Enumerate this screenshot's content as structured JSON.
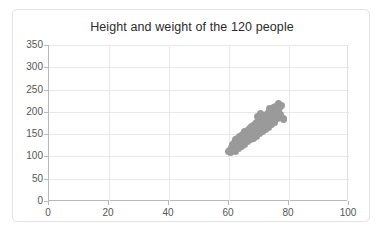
{
  "chart_data": {
    "type": "scatter",
    "title": "Height and weight of the 120 people",
    "xlabel": "",
    "ylabel": "",
    "xlim": [
      0,
      100
    ],
    "ylim": [
      0,
      350
    ],
    "xticks": [
      0,
      20,
      40,
      60,
      80,
      100
    ],
    "yticks": [
      0,
      50,
      100,
      150,
      200,
      250,
      300,
      350
    ],
    "grid": true,
    "legend": "none",
    "marker_color": "#9a9a9a",
    "series": [
      {
        "name": "people",
        "n": 120,
        "points": [
          [
            59.8,
            110
          ],
          [
            60.2,
            113
          ],
          [
            60.5,
            108
          ],
          [
            60.9,
            121
          ],
          [
            61.1,
            116
          ],
          [
            61.3,
            127
          ],
          [
            61.5,
            119
          ],
          [
            61.8,
            131
          ],
          [
            62.0,
            124
          ],
          [
            62.2,
            137
          ],
          [
            62.4,
            118
          ],
          [
            62.6,
            129
          ],
          [
            62.8,
            141
          ],
          [
            63.0,
            126
          ],
          [
            63.2,
            134
          ],
          [
            63.4,
            122
          ],
          [
            63.6,
            145
          ],
          [
            63.8,
            133
          ],
          [
            64.0,
            139
          ],
          [
            64.2,
            128
          ],
          [
            64.4,
            150
          ],
          [
            64.6,
            136
          ],
          [
            64.8,
            143
          ],
          [
            65.0,
            131
          ],
          [
            65.2,
            155
          ],
          [
            65.4,
            140
          ],
          [
            65.6,
            147
          ],
          [
            65.8,
            135
          ],
          [
            66.0,
            158
          ],
          [
            66.2,
            144
          ],
          [
            66.4,
            152
          ],
          [
            66.6,
            139
          ],
          [
            66.8,
            163
          ],
          [
            67.0,
            148
          ],
          [
            67.2,
            156
          ],
          [
            67.4,
            142
          ],
          [
            67.6,
            167
          ],
          [
            67.8,
            153
          ],
          [
            68.0,
            160
          ],
          [
            68.2,
            146
          ],
          [
            68.4,
            172
          ],
          [
            68.6,
            157
          ],
          [
            68.8,
            165
          ],
          [
            69.0,
            150
          ],
          [
            69.2,
            176
          ],
          [
            69.4,
            161
          ],
          [
            69.6,
            169
          ],
          [
            69.8,
            154
          ],
          [
            70.0,
            181
          ],
          [
            70.2,
            166
          ],
          [
            70.4,
            174
          ],
          [
            70.6,
            158
          ],
          [
            70.8,
            186
          ],
          [
            71.0,
            170
          ],
          [
            71.2,
            178
          ],
          [
            71.4,
            163
          ],
          [
            71.6,
            190
          ],
          [
            71.8,
            175
          ],
          [
            72.0,
            183
          ],
          [
            72.2,
            167
          ],
          [
            72.4,
            195
          ],
          [
            72.6,
            179
          ],
          [
            72.8,
            188
          ],
          [
            73.0,
            171
          ],
          [
            73.2,
            199
          ],
          [
            73.4,
            184
          ],
          [
            73.6,
            192
          ],
          [
            73.8,
            176
          ],
          [
            74.0,
            204
          ],
          [
            74.2,
            188
          ],
          [
            74.4,
            197
          ],
          [
            74.6,
            180
          ],
          [
            74.8,
            209
          ],
          [
            75.0,
            193
          ],
          [
            75.2,
            201
          ],
          [
            75.4,
            185
          ],
          [
            75.6,
            213
          ],
          [
            75.8,
            197
          ],
          [
            76.0,
            206
          ],
          [
            76.2,
            189
          ],
          [
            76.4,
            218
          ],
          [
            76.6,
            202
          ],
          [
            76.8,
            210
          ],
          [
            77.2,
            194
          ],
          [
            77.6,
            215
          ],
          [
            78.0,
            185
          ],
          [
            78.3,
            183
          ],
          [
            62.3,
            112
          ],
          [
            63.1,
            117
          ],
          [
            64.1,
            123
          ],
          [
            65.1,
            126
          ],
          [
            66.1,
            133
          ],
          [
            67.1,
            137
          ],
          [
            68.1,
            141
          ],
          [
            69.1,
            145
          ],
          [
            70.1,
            152
          ],
          [
            71.1,
            156
          ],
          [
            72.1,
            161
          ],
          [
            73.1,
            165
          ],
          [
            74.1,
            172
          ],
          [
            75.1,
            177
          ],
          [
            76.1,
            184
          ],
          [
            61.6,
            122
          ],
          [
            62.7,
            132
          ],
          [
            63.7,
            128
          ],
          [
            64.7,
            146
          ],
          [
            65.7,
            151
          ],
          [
            66.7,
            155
          ],
          [
            67.7,
            161
          ],
          [
            68.7,
            169
          ],
          [
            69.7,
            173
          ],
          [
            70.7,
            179
          ],
          [
            71.7,
            186
          ],
          [
            72.7,
            191
          ],
          [
            73.7,
            196
          ],
          [
            74.7,
            203
          ],
          [
            75.7,
            208
          ],
          [
            69.5,
            190
          ],
          [
            70.5,
            196
          ],
          [
            71.5,
            168
          ],
          [
            72.5,
            172
          ],
          [
            73.5,
            207
          ]
        ]
      }
    ]
  }
}
